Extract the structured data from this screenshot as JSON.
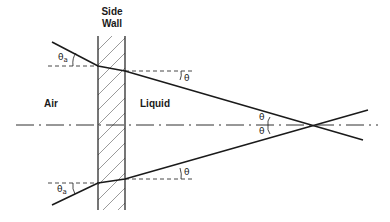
{
  "diagram": {
    "labels": {
      "wall_line1": "Side",
      "wall_line2": "Wall",
      "air": "Air",
      "liquid": "Liquid"
    },
    "angles": {
      "theta": "θ",
      "theta_a_symbol": "θ",
      "theta_a_sub": "a"
    },
    "colors": {
      "line": "#1a1a1a",
      "background": "#ffffff"
    }
  }
}
